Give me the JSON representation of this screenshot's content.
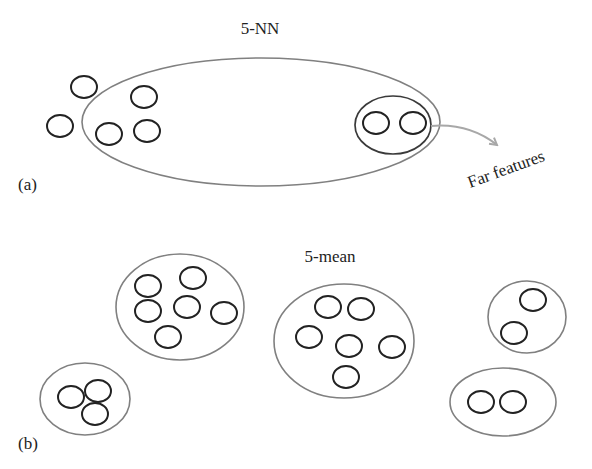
{
  "panel_a": {
    "label": "(a)",
    "title": "5-NN",
    "annotation": "Far features",
    "neighborhood_ellipse": {
      "cx": 261,
      "cy": 122,
      "rx": 179,
      "ry": 64
    },
    "far_group_ellipse": {
      "cx": 393,
      "cy": 125,
      "rx": 38,
      "ry": 29
    },
    "points_outside": [
      {
        "cx": 84,
        "cy": 87
      },
      {
        "cx": 60,
        "cy": 126
      }
    ],
    "points_inside": [
      {
        "cx": 144,
        "cy": 97
      },
      {
        "cx": 109,
        "cy": 134
      },
      {
        "cx": 147,
        "cy": 131
      }
    ],
    "points_far": [
      {
        "cx": 376,
        "cy": 123
      },
      {
        "cx": 413,
        "cy": 123
      }
    ]
  },
  "panel_b": {
    "label": "(b)",
    "title": "5-mean",
    "clusters": [
      {
        "ellipse": {
          "cx": 180,
          "cy": 307,
          "rx": 64,
          "ry": 53
        },
        "points": [
          {
            "cx": 148,
            "cy": 286
          },
          {
            "cx": 193,
            "cy": 278
          },
          {
            "cx": 148,
            "cy": 311
          },
          {
            "cx": 187,
            "cy": 307
          },
          {
            "cx": 224,
            "cy": 313
          },
          {
            "cx": 168,
            "cy": 337
          }
        ]
      },
      {
        "ellipse": {
          "cx": 344,
          "cy": 341,
          "rx": 70,
          "ry": 57
        },
        "points": [
          {
            "cx": 328,
            "cy": 307
          },
          {
            "cx": 361,
            "cy": 309
          },
          {
            "cx": 309,
            "cy": 337
          },
          {
            "cx": 349,
            "cy": 346
          },
          {
            "cx": 392,
            "cy": 347
          },
          {
            "cx": 346,
            "cy": 377
          }
        ]
      },
      {
        "ellipse": {
          "cx": 527,
          "cy": 317,
          "rx": 39,
          "ry": 36
        },
        "points": [
          {
            "cx": 533,
            "cy": 300
          },
          {
            "cx": 514,
            "cy": 333
          }
        ]
      },
      {
        "ellipse": {
          "cx": 503,
          "cy": 402,
          "rx": 53,
          "ry": 34
        },
        "points": [
          {
            "cx": 481,
            "cy": 402
          },
          {
            "cx": 513,
            "cy": 402
          }
        ]
      },
      {
        "ellipse": {
          "cx": 85,
          "cy": 399,
          "rx": 45,
          "ry": 36
        },
        "points": [
          {
            "cx": 71,
            "cy": 397
          },
          {
            "cx": 98,
            "cy": 391
          },
          {
            "cx": 95,
            "cy": 414
          }
        ]
      }
    ]
  },
  "style": {
    "point_rx": 13,
    "point_ry": 11,
    "ellipse_stroke": "#808080",
    "point_stroke": "#222222",
    "arrow_stroke": "#a8a8a8"
  }
}
